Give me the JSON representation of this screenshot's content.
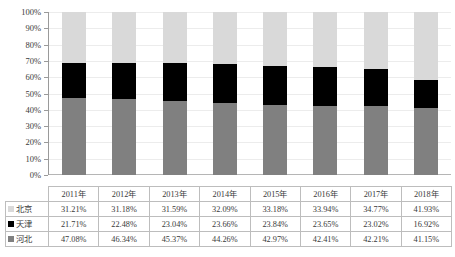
{
  "chart_data": {
    "type": "bar",
    "subtype": "100%-stacked-column",
    "title": "",
    "xlabel": "",
    "ylabel": "",
    "ylim": [
      0,
      100
    ],
    "yunit": "%",
    "grid": true,
    "legend_position": "table-left-column",
    "categories": [
      "2011年",
      "2012年",
      "2013年",
      "2014年",
      "2015年",
      "2016年",
      "2017年",
      "2018年"
    ],
    "ytick_labels": [
      "100%",
      "90%",
      "80%",
      "70%",
      "60%",
      "50%",
      "40%",
      "30%",
      "20%",
      "10%",
      "0%"
    ],
    "ytick_values": [
      100,
      90,
      80,
      70,
      60,
      50,
      40,
      30,
      20,
      10,
      0
    ],
    "stack_order_bottom_to_top": [
      "河北",
      "天津",
      "北京"
    ],
    "series": [
      {
        "name": "北京",
        "color": "#d9d9d9",
        "values": [
          31.21,
          31.18,
          31.59,
          32.09,
          33.18,
          33.94,
          34.77,
          41.93
        ],
        "labels": [
          "31.21%",
          "31.18%",
          "31.59%",
          "32.09%",
          "33.18%",
          "33.94%",
          "34.77%",
          "41.93%"
        ]
      },
      {
        "name": "天津",
        "color": "#000000",
        "values": [
          21.71,
          22.48,
          23.04,
          23.66,
          23.84,
          23.65,
          23.02,
          16.92
        ],
        "labels": [
          "21.71%",
          "22.48%",
          "23.04%",
          "23.66%",
          "23.84%",
          "23.65%",
          "23.02%",
          "16.92%"
        ]
      },
      {
        "name": "河北",
        "color": "#808080",
        "values": [
          47.08,
          46.34,
          45.37,
          44.26,
          42.97,
          42.41,
          42.21,
          41.15
        ],
        "labels": [
          "47.08%",
          "46.34%",
          "45.37%",
          "44.26%",
          "42.97%",
          "42.41%",
          "42.21%",
          "41.15%"
        ]
      }
    ]
  },
  "table": {
    "header_row": [
      "",
      "2011年",
      "2012年",
      "2013年",
      "2014年",
      "2015年",
      "2016年",
      "2017年",
      "2018年"
    ],
    "rows": [
      {
        "label": "北京",
        "swatch": "#d9d9d9",
        "cells": [
          "31.21%",
          "31.18%",
          "31.59%",
          "32.09%",
          "33.18%",
          "33.94%",
          "34.77%",
          "41.93%"
        ]
      },
      {
        "label": "天津",
        "swatch": "#000000",
        "cells": [
          "21.71%",
          "22.48%",
          "23.04%",
          "23.66%",
          "23.84%",
          "23.65%",
          "23.02%",
          "16.92%"
        ]
      },
      {
        "label": "河北",
        "swatch": "#808080",
        "cells": [
          "47.08%",
          "46.34%",
          "45.37%",
          "44.26%",
          "42.97%",
          "42.41%",
          "42.21%",
          "41.15%"
        ]
      }
    ]
  }
}
